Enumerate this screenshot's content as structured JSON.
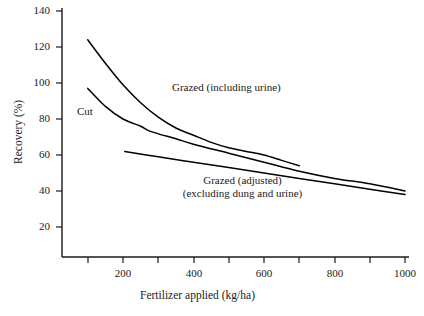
{
  "chart_data": {
    "type": "line",
    "title": "",
    "xlabel": "Fertilizer applied (kg/ha)",
    "ylabel": "Recovery (%)",
    "xlim": [
      50,
      1000
    ],
    "ylim": [
      10,
      140
    ],
    "xticks": [
      100,
      200,
      300,
      400,
      500,
      600,
      700,
      800,
      900,
      1000
    ],
    "xtick_labels": [
      "",
      "200",
      "",
      "400",
      "",
      "600",
      "",
      "800",
      "",
      "1000"
    ],
    "yticks": [
      20,
      40,
      60,
      80,
      100,
      120,
      140
    ],
    "ytick_labels": [
      "20",
      "40",
      "60",
      "80",
      "100",
      "120",
      "140"
    ],
    "grid": false,
    "legend": "inline annotations",
    "series": [
      {
        "name": "Grazed (including urine)",
        "points": [
          [
            100,
            124
          ],
          [
            150,
            111
          ],
          [
            200,
            99
          ],
          [
            250,
            89
          ],
          [
            300,
            81
          ],
          [
            350,
            75
          ],
          [
            400,
            71
          ],
          [
            450,
            67
          ],
          [
            500,
            64
          ],
          [
            550,
            62
          ],
          [
            600,
            60
          ],
          [
            650,
            57
          ],
          [
            700,
            54
          ]
        ]
      },
      {
        "name": "Cut",
        "points": [
          [
            100,
            97
          ],
          [
            150,
            87
          ],
          [
            200,
            80
          ],
          [
            250,
            76
          ],
          [
            280,
            73
          ],
          [
            350,
            69
          ],
          [
            400,
            66
          ],
          [
            500,
            61
          ],
          [
            600,
            56
          ],
          [
            700,
            51
          ],
          [
            800,
            47
          ],
          [
            900,
            44
          ],
          [
            1000,
            40
          ]
        ]
      },
      {
        "name": "Grazed (adjusted) (excluding dung and urine)",
        "points": [
          [
            205,
            62
          ],
          [
            300,
            59
          ],
          [
            400,
            56
          ],
          [
            500,
            53
          ],
          [
            600,
            50
          ],
          [
            700,
            47
          ],
          [
            800,
            44
          ],
          [
            900,
            41
          ],
          [
            1000,
            38
          ]
        ]
      }
    ],
    "annotations": [
      {
        "text": "Grazed (including urine)",
        "x_px": 172,
        "y_px": 88
      },
      {
        "text": "Cut",
        "x_px": 77,
        "y_px": 110
      },
      {
        "text": "Grazed (adjusted)",
        "x_px": 242,
        "y_px": 180
      },
      {
        "text": "(excluding dung and urine)",
        "x_px": 242,
        "y_px": 192
      }
    ]
  },
  "axes": {
    "x_title": "Fertilizer applied (kg/ha)",
    "y_title": "Recovery (%)",
    "x_tick_texts": [
      "200",
      "400",
      "600",
      "800",
      "1000"
    ],
    "y_tick_texts": [
      "140",
      "120",
      "100",
      "80",
      "60",
      "40",
      "20"
    ]
  },
  "annotations": {
    "grazed_including_urine": "Grazed (including urine)",
    "cut": "Cut",
    "grazed_adjusted_line1": "Grazed (adjusted)",
    "grazed_adjusted_line2": "(excluding dung and urine)"
  },
  "colors": {
    "line": "#000000",
    "axis": "#1a1a1a",
    "background": "#ffffff",
    "text": "#1a1a1a"
  }
}
